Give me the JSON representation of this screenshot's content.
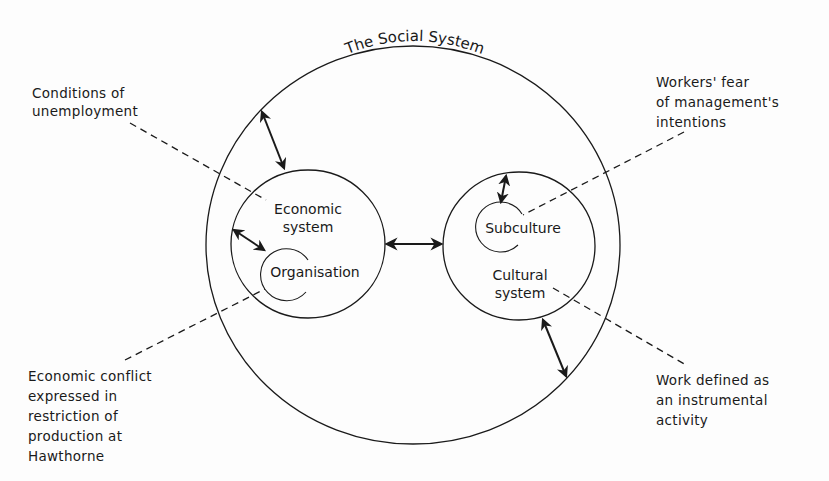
{
  "diagram": {
    "title": "The Social System",
    "colors": {
      "ink": "#1a1a1a",
      "background": "#fdfdfd"
    },
    "systems": [
      {
        "id": "economic",
        "label": "Economic\nsystem",
        "contains": "Organisation"
      },
      {
        "id": "cultural",
        "label": "Cultural\nsystem",
        "contains": "Subculture"
      }
    ],
    "subsystems": {
      "organisation": "Organisation",
      "subculture": "Subculture"
    },
    "annotations": {
      "unemployment": "Conditions of\nunemployment",
      "economic_conflict": "Economic conflict\nexpressed in\nrestriction of\nproduction at\nHawthorne",
      "workers_fear": "Workers' fear\nof management's\nintentions",
      "work_defined": "Work defined as\nan instrumental\nactivity"
    },
    "relations": [
      {
        "from": "The Social System",
        "to": "Economic system",
        "type": "double-arrow"
      },
      {
        "from": "Economic system",
        "to": "Organisation",
        "type": "double-arrow"
      },
      {
        "from": "Economic system",
        "to": "Cultural system",
        "type": "double-arrow"
      },
      {
        "from": "Cultural system",
        "to": "Subculture",
        "type": "double-arrow"
      },
      {
        "from": "Cultural system",
        "to": "The Social System",
        "type": "double-arrow"
      }
    ],
    "leaders": [
      {
        "annotation": "Conditions of unemployment",
        "points_to": "Economic system"
      },
      {
        "annotation": "Economic conflict expressed in restriction of production at Hawthorne",
        "points_to": "Organisation"
      },
      {
        "annotation": "Workers' fear of management's intentions",
        "points_to": "Subculture"
      },
      {
        "annotation": "Work defined as an instrumental activity",
        "points_to": "Cultural system"
      }
    ]
  }
}
